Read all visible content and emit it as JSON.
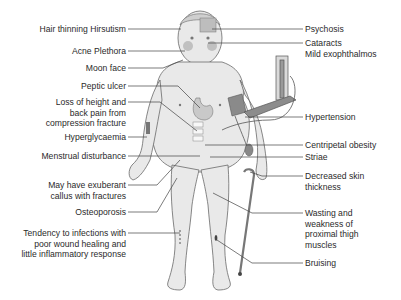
{
  "diagram": {
    "title": "",
    "left_labels": [
      {
        "id": "hair",
        "text": "Hair thinning Hirsutism",
        "x": 2,
        "y": 24,
        "w": 124
      },
      {
        "id": "acne",
        "text": "Acne Plethora",
        "x": 2,
        "y": 46,
        "w": 124
      },
      {
        "id": "moon",
        "text": "Moon face",
        "x": 2,
        "y": 63,
        "w": 124
      },
      {
        "id": "peptic",
        "text": "Peptic ulcer",
        "x": 2,
        "y": 81,
        "w": 124
      },
      {
        "id": "loss",
        "text": "Loss of height and\nback pain from\ncompression fracture",
        "x": 2,
        "y": 97,
        "w": 124
      },
      {
        "id": "hyper",
        "text": "Hyperglycaemia",
        "x": 2,
        "y": 132,
        "w": 124
      },
      {
        "id": "menstrual",
        "text": "Menstrual disturbance",
        "x": 2,
        "y": 151,
        "w": 124
      },
      {
        "id": "callus",
        "text": "May have exuberant\ncallus with fractures",
        "x": 2,
        "y": 180,
        "w": 124
      },
      {
        "id": "osteo",
        "text": "Osteoporosis",
        "x": 2,
        "y": 207,
        "w": 124
      },
      {
        "id": "infection",
        "text": "Tendency to infections with\npoor wound healing and\nlittle inflammatory response",
        "x": 2,
        "y": 228,
        "w": 124
      }
    ],
    "right_labels": [
      {
        "id": "psychosis",
        "text": "Psychosis",
        "x": 305,
        "y": 24
      },
      {
        "id": "cataracts",
        "text": "Cataracts\nMild exophthalmos",
        "x": 305,
        "y": 38
      },
      {
        "id": "hypertension",
        "text": "Hypertension",
        "x": 305,
        "y": 112
      },
      {
        "id": "centripetal",
        "text": "Centripetal obesity",
        "x": 305,
        "y": 140
      },
      {
        "id": "striae",
        "text": "Striae",
        "x": 305,
        "y": 152
      },
      {
        "id": "skin",
        "text": "Decreased skin\nthickness",
        "x": 305,
        "y": 171
      },
      {
        "id": "wasting",
        "text": "Wasting and\nweakness of\nproximal thigh\nmuscles",
        "x": 305,
        "y": 208
      },
      {
        "id": "bruising",
        "text": "Bruising",
        "x": 305,
        "y": 258
      }
    ],
    "colors": {
      "body_fill": "#e9e9e9",
      "outline": "#6a6a6a",
      "line": "#444444",
      "text": "#2a2a2a",
      "dark": "#555555"
    }
  }
}
